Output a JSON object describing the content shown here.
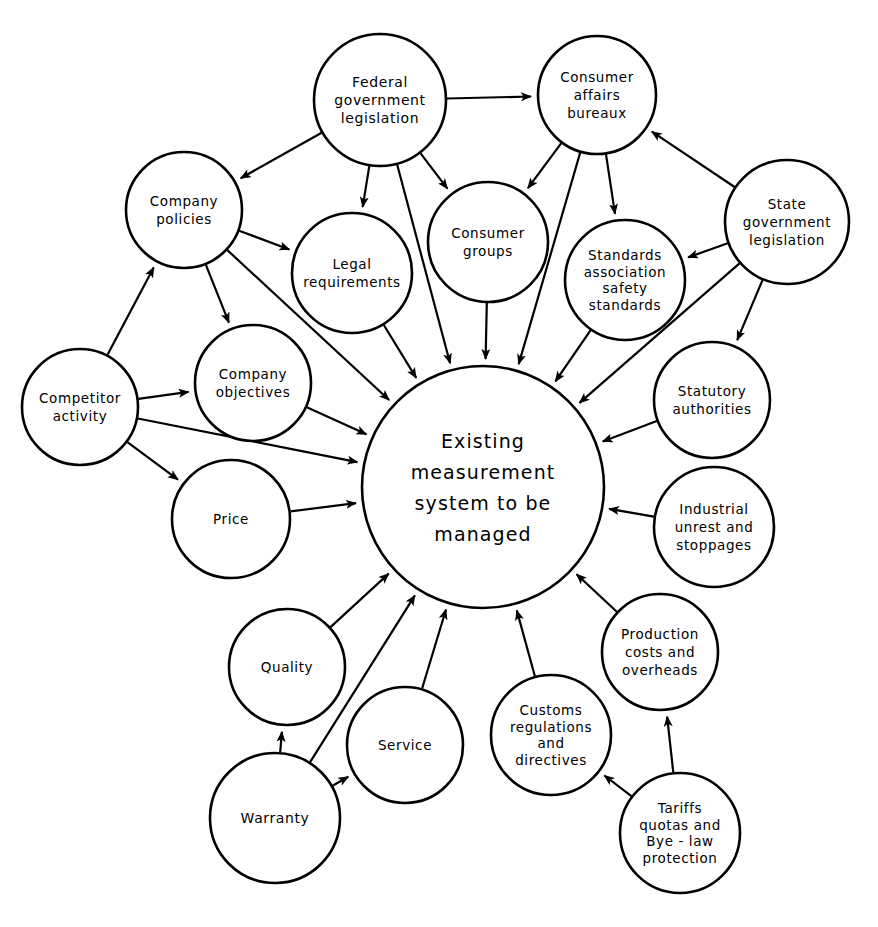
{
  "diagram": {
    "type": "node-link influence diagram",
    "background_color": "#ffffff",
    "line_color": "#000000",
    "center": {
      "id": "center",
      "label_lines": [
        "Existing",
        "measurement",
        "system  to be",
        "managed"
      ],
      "cx": 483,
      "cy": 487,
      "r": 121
    },
    "nodes": [
      {
        "id": "federal-government-legislation",
        "label_lines": [
          "Federal",
          "government",
          "legislation"
        ],
        "cx": 380,
        "cy": 100,
        "r": 66
      },
      {
        "id": "consumer-affairs-bureaux",
        "label_lines": [
          "Consumer",
          "affairs",
          "bureaux"
        ],
        "cx": 597,
        "cy": 95,
        "r": 59
      },
      {
        "id": "company-policies",
        "label_lines": [
          "Company",
          "policies"
        ],
        "cx": 184,
        "cy": 210,
        "r": 58
      },
      {
        "id": "legal-requirements",
        "label_lines": [
          "Legal",
          "requirements"
        ],
        "cx": 352,
        "cy": 273,
        "r": 60
      },
      {
        "id": "consumer-groups",
        "label_lines": [
          "Consumer",
          "groups"
        ],
        "cx": 488,
        "cy": 242,
        "r": 60
      },
      {
        "id": "standards-association-safety-standards",
        "label_lines": [
          "Standards",
          "association",
          "safety",
          "standards"
        ],
        "cx": 625,
        "cy": 280,
        "r": 60
      },
      {
        "id": "state-government-legislation",
        "label_lines": [
          "State",
          "government",
          "legislation"
        ],
        "cx": 787,
        "cy": 222,
        "r": 62
      },
      {
        "id": "competitor-activity",
        "label_lines": [
          "Competitor",
          "activity"
        ],
        "cx": 80,
        "cy": 407,
        "r": 58
      },
      {
        "id": "company-objectives",
        "label_lines": [
          "Company",
          "objectives"
        ],
        "cx": 253,
        "cy": 383,
        "r": 58
      },
      {
        "id": "statutory-authorities",
        "label_lines": [
          "Statutory",
          "authorities"
        ],
        "cx": 712,
        "cy": 400,
        "r": 58
      },
      {
        "id": "price",
        "label_lines": [
          "Price"
        ],
        "cx": 231,
        "cy": 519,
        "r": 59
      },
      {
        "id": "industrial-unrest-and-stoppages",
        "label_lines": [
          "Industrial",
          "unrest and",
          "stoppages"
        ],
        "cx": 714,
        "cy": 527,
        "r": 60
      },
      {
        "id": "quality",
        "label_lines": [
          "Quality"
        ],
        "cx": 287,
        "cy": 667,
        "r": 58
      },
      {
        "id": "production-costs-and-overheads",
        "label_lines": [
          "Production",
          "costs and",
          "overheads"
        ],
        "cx": 660,
        "cy": 652,
        "r": 58
      },
      {
        "id": "service",
        "label_lines": [
          "Service"
        ],
        "cx": 405,
        "cy": 745,
        "r": 58
      },
      {
        "id": "customs-regulations-and-directives",
        "label_lines": [
          "Customs",
          "regulations",
          "and",
          "directives"
        ],
        "cx": 551,
        "cy": 735,
        "r": 60
      },
      {
        "id": "warranty",
        "label_lines": [
          "Warranty"
        ],
        "cx": 275,
        "cy": 818,
        "r": 65
      },
      {
        "id": "tariffs-quotas-and-bye-law-protection",
        "label_lines": [
          "Tariffs",
          "quotas and",
          "Bye - law",
          "protection"
        ],
        "cx": 680,
        "cy": 833,
        "r": 60
      }
    ],
    "edges": [
      {
        "from": "federal-government-legislation",
        "to": "consumer-affairs-bureaux",
        "arrow": "to"
      },
      {
        "from": "federal-government-legislation",
        "to": "company-policies",
        "arrow": "to"
      },
      {
        "from": "federal-government-legislation",
        "to": "legal-requirements",
        "arrow": "to"
      },
      {
        "from": "federal-government-legislation",
        "to": "consumer-groups",
        "arrow": "to"
      },
      {
        "from": "federal-government-legislation",
        "to": "center",
        "arrow": "to"
      },
      {
        "from": "consumer-affairs-bureaux",
        "to": "consumer-groups",
        "arrow": "to"
      },
      {
        "from": "consumer-affairs-bureaux",
        "to": "standards-association-safety-standards",
        "arrow": "to"
      },
      {
        "from": "consumer-affairs-bureaux",
        "to": "center",
        "arrow": "to"
      },
      {
        "from": "state-government-legislation",
        "to": "consumer-affairs-bureaux",
        "arrow": "to"
      },
      {
        "from": "state-government-legislation",
        "to": "standards-association-safety-standards",
        "arrow": "to"
      },
      {
        "from": "state-government-legislation",
        "to": "statutory-authorities",
        "arrow": "to"
      },
      {
        "from": "state-government-legislation",
        "to": "center",
        "arrow": "to"
      },
      {
        "from": "company-policies",
        "to": "legal-requirements",
        "arrow": "to"
      },
      {
        "from": "company-policies",
        "to": "company-objectives",
        "arrow": "to"
      },
      {
        "from": "company-policies",
        "to": "center",
        "arrow": "to"
      },
      {
        "from": "legal-requirements",
        "to": "center",
        "arrow": "to"
      },
      {
        "from": "consumer-groups",
        "to": "center",
        "arrow": "to"
      },
      {
        "from": "standards-association-safety-standards",
        "to": "center",
        "arrow": "to"
      },
      {
        "from": "statutory-authorities",
        "to": "center",
        "arrow": "to"
      },
      {
        "from": "competitor-activity",
        "to": "company-policies",
        "arrow": "to"
      },
      {
        "from": "competitor-activity",
        "to": "company-objectives",
        "arrow": "to"
      },
      {
        "from": "competitor-activity",
        "to": "center",
        "arrow": "to"
      },
      {
        "from": "competitor-activity",
        "to": "price",
        "arrow": "to"
      },
      {
        "from": "company-objectives",
        "to": "center",
        "arrow": "to"
      },
      {
        "from": "price",
        "to": "center",
        "arrow": "to"
      },
      {
        "from": "industrial-unrest-and-stoppages",
        "to": "center",
        "arrow": "to"
      },
      {
        "from": "quality",
        "to": "center",
        "arrow": "to"
      },
      {
        "from": "production-costs-and-overheads",
        "to": "center",
        "arrow": "to"
      },
      {
        "from": "service",
        "to": "center",
        "arrow": "to"
      },
      {
        "from": "customs-regulations-and-directives",
        "to": "center",
        "arrow": "to"
      },
      {
        "from": "warranty",
        "to": "quality",
        "arrow": "to"
      },
      {
        "from": "warranty",
        "to": "service",
        "arrow": "to"
      },
      {
        "from": "warranty",
        "to": "center",
        "arrow": "to"
      },
      {
        "from": "tariffs-quotas-and-bye-law-protection",
        "to": "customs-regulations-and-directives",
        "arrow": "to"
      },
      {
        "from": "tariffs-quotas-and-bye-law-protection",
        "to": "production-costs-and-overheads",
        "arrow": "to"
      }
    ]
  }
}
